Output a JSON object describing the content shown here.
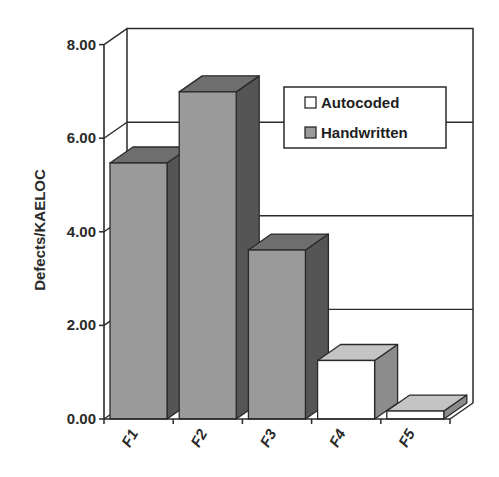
{
  "chart_data": {
    "type": "bar",
    "style": "3d-clustered-column",
    "title": "",
    "xlabel": "",
    "ylabel": "Defects/KAELOC",
    "ylim": [
      0,
      8
    ],
    "yticks": [
      "0.00",
      "2.00",
      "4.00",
      "6.00",
      "8.00"
    ],
    "grid": true,
    "legend_position": "upper-right-inside",
    "categories": [
      "F1",
      "F2",
      "F3",
      "F4",
      "F5"
    ],
    "series": [
      {
        "name": "Autocoded",
        "color": "#ffffff",
        "values": [
          null,
          null,
          null,
          1.25,
          0.17
        ]
      },
      {
        "name": "Handwritten",
        "color": "#9a9a9a",
        "values": [
          5.47,
          6.99,
          3.61,
          null,
          null
        ]
      }
    ]
  },
  "legend": {
    "items": [
      {
        "label": "Autocoded",
        "color": "#ffffff"
      },
      {
        "label": "Handwritten",
        "color": "#9a9a9a"
      }
    ]
  },
  "colors": {
    "handwritten_front": "#9a9a9a",
    "handwritten_top": "#6e6e6e",
    "handwritten_side": "#555555",
    "autocoded_front": "#ffffff",
    "autocoded_top": "#c4c4c4",
    "autocoded_side": "#8c8c8c",
    "line": "#2a2a2a"
  }
}
